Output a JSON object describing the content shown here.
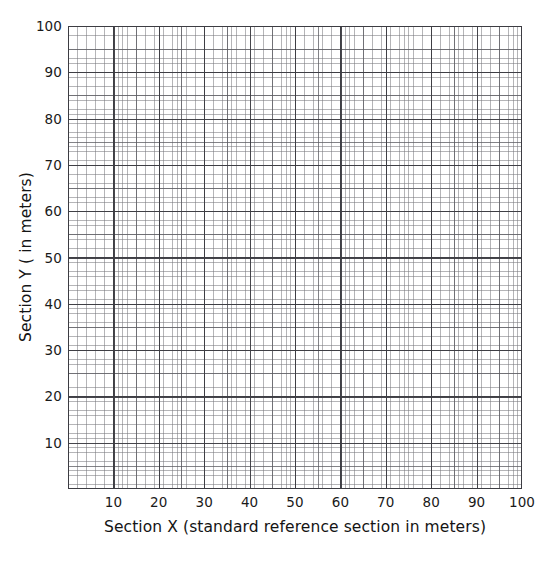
{
  "chart_data": {
    "type": "grid",
    "title": "",
    "subtitle": "",
    "xlabel": "Section X (standard reference section in meters)",
    "ylabel": "Section Y ( in meters)",
    "xlim": [
      0,
      100
    ],
    "ylim": [
      0,
      100
    ],
    "x_tick_labels": [
      "10",
      "20",
      "30",
      "40",
      "50",
      "60",
      "70",
      "80",
      "90",
      "100"
    ],
    "x_tick_values": [
      10,
      20,
      30,
      40,
      50,
      60,
      70,
      80,
      90,
      100
    ],
    "y_tick_labels": [
      "100",
      "90",
      "80",
      "70",
      "60",
      "50",
      "40",
      "30",
      "20",
      "10"
    ],
    "y_tick_values": [
      100,
      90,
      80,
      70,
      60,
      50,
      40,
      30,
      20,
      10
    ],
    "grid": true,
    "grid_major_step": 10,
    "grid_medium_step": 5,
    "grid_minor_step": 1,
    "legend": null,
    "series": [],
    "values": [],
    "annotations": [],
    "colors": {
      "background": "#ffffff",
      "grid_major": "#3c3c42",
      "grid_medium": "#5a5a60",
      "grid_minor": "#78787d",
      "text": "#1a1a1a"
    }
  },
  "axes": {
    "x": {
      "title": "Section X (standard reference section in meters)",
      "ticks": [
        {
          "label": "10",
          "value": 10
        },
        {
          "label": "20",
          "value": 20
        },
        {
          "label": "30",
          "value": 30
        },
        {
          "label": "40",
          "value": 40
        },
        {
          "label": "50",
          "value": 50
        },
        {
          "label": "60",
          "value": 60
        },
        {
          "label": "70",
          "value": 70
        },
        {
          "label": "80",
          "value": 80
        },
        {
          "label": "90",
          "value": 90
        },
        {
          "label": "100",
          "value": 100
        }
      ]
    },
    "y": {
      "title": "Section Y ( in meters)",
      "ticks": [
        {
          "label": "100",
          "value": 100
        },
        {
          "label": "90",
          "value": 90
        },
        {
          "label": "80",
          "value": 80
        },
        {
          "label": "70",
          "value": 70
        },
        {
          "label": "60",
          "value": 60
        },
        {
          "label": "50",
          "value": 50
        },
        {
          "label": "40",
          "value": 40
        },
        {
          "label": "30",
          "value": 30
        },
        {
          "label": "20",
          "value": 20
        },
        {
          "label": "10",
          "value": 10
        }
      ]
    }
  }
}
